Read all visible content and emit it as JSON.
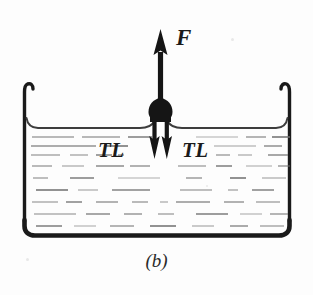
{
  "figure": {
    "caption": "(b)",
    "force_label": "F",
    "tension_label_left": "TL",
    "tension_label_right": "TL",
    "colors": {
      "ink": "#1a1a1a",
      "liquid_line": "#6f6f6f",
      "surface_line": "#4a4a4a",
      "background": "#fdfdfd"
    },
    "container": {
      "name": "beaker",
      "left_wall_x": 27,
      "right_wall_x": 288,
      "rim_y": 90,
      "bottom_y": 235,
      "wall_thickness": 3.2,
      "bottom_thickness": 5.5,
      "corner_radius": 12
    },
    "liquid": {
      "surface_y": 128,
      "meniscus_rise": 10,
      "dash_rows": [
        {
          "y": 137,
          "segments": [
            [
              32,
              74
            ],
            [
              82,
              120
            ],
            [
              128,
              152
            ],
            [
              196,
              238
            ],
            [
              246,
              266
            ],
            [
              272,
              290
            ]
          ]
        },
        {
          "y": 146,
          "segments": [
            [
              31,
              96
            ],
            [
              104,
              128
            ],
            [
              214,
              256
            ],
            [
              264,
              282
            ]
          ]
        },
        {
          "y": 155,
          "segments": [
            [
              31,
              60
            ],
            [
              70,
              88
            ],
            [
              96,
              112
            ],
            [
              118,
              124
            ],
            [
              216,
              230
            ],
            [
              238,
              252
            ],
            [
              268,
              288
            ]
          ]
        },
        {
          "y": 166,
          "segments": [
            [
              32,
              52
            ],
            [
              62,
              84
            ],
            [
              96,
              124
            ],
            [
              130,
              150
            ],
            [
              178,
              206
            ],
            [
              216,
              232
            ],
            [
              246,
              272
            ],
            [
              278,
              290
            ]
          ]
        },
        {
          "y": 178,
          "segments": [
            [
              33,
              48
            ],
            [
              70,
              94
            ],
            [
              118,
              160
            ],
            [
              186,
              202
            ],
            [
              230,
              246
            ],
            [
              262,
              286
            ]
          ]
        },
        {
          "y": 190,
          "segments": [
            [
              36,
              68
            ],
            [
              78,
              98
            ],
            [
              112,
              150
            ],
            [
              180,
              212
            ],
            [
              228,
              238
            ],
            [
              252,
              274
            ]
          ]
        },
        {
          "y": 202,
          "segments": [
            [
              32,
              58
            ],
            [
              66,
              82
            ],
            [
              96,
              118
            ],
            [
              132,
              148
            ],
            [
              160,
              168
            ],
            [
              176,
              210
            ],
            [
              224,
              244
            ],
            [
              256,
              280
            ]
          ]
        },
        {
          "y": 214,
          "segments": [
            [
              34,
              76
            ],
            [
              86,
              110
            ],
            [
              124,
              142
            ],
            [
              158,
              174
            ],
            [
              196,
              228
            ],
            [
              240,
              262
            ],
            [
              270,
              288
            ]
          ]
        },
        {
          "y": 226,
          "segments": [
            [
              36,
              62
            ],
            [
              74,
              96
            ],
            [
              110,
              134
            ],
            [
              150,
              176
            ],
            [
              192,
              214
            ],
            [
              230,
              248
            ],
            [
              260,
              284
            ]
          ]
        }
      ]
    },
    "apparatus": {
      "name": "wire-frame-pull-rod",
      "stem_x": 160,
      "stem_top_y": 34,
      "stem_bottom_y": 104,
      "stem_width": 5,
      "arrow_head_top_y": 30,
      "arrow_head_width": 13,
      "arrow_head_height": 22,
      "hub_center_y": 112,
      "hub_width": 26,
      "hub_height": 20,
      "prong_left_x": 154,
      "prong_right_x": 167,
      "prong_top_y": 120,
      "prong_bottom_y": 150,
      "prong_width": 4,
      "prong_arrow_height": 18,
      "prong_arrow_width": 11
    }
  }
}
